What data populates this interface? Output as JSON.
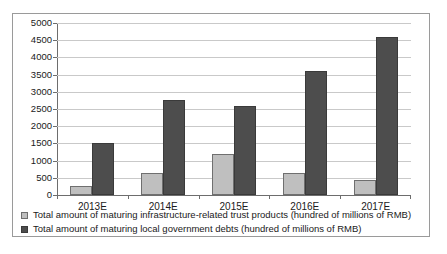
{
  "chart_data": {
    "type": "bar",
    "title": "",
    "xlabel": "",
    "ylabel": "",
    "categories": [
      "2013E",
      "2014E",
      "2015E",
      "2016E",
      "2017E"
    ],
    "ylim": [
      0,
      5000
    ],
    "ytick_step": 500,
    "ytick_labels": [
      "5000",
      "4500",
      "4000",
      "3500",
      "3000",
      "2500",
      "2000",
      "1500",
      "1000",
      "500",
      "0"
    ],
    "grid": true,
    "legend_position": "bottom-left",
    "series": [
      {
        "name": "Total amount of maturing infrastructure-related trust products (hundred of millions of RMB)",
        "color": "#bfbfbf",
        "values": [
          250,
          650,
          1200,
          650,
          450
        ]
      },
      {
        "name": "Total amount of maturing local government debts (hundred of millions of RMB)",
        "color": "#4d4d4d",
        "values": [
          1500,
          2750,
          2600,
          3600,
          4600
        ]
      }
    ]
  },
  "legend": {
    "items": [
      {
        "label": "Total amount of maturing infrastructure-related trust products (hundred of millions of RMB)",
        "swatch": "light-gray-swatch-icon"
      },
      {
        "label": "Total amount of maturing local government debts (hundred of millions of RMB)",
        "swatch": "dark-gray-swatch-icon"
      }
    ]
  }
}
